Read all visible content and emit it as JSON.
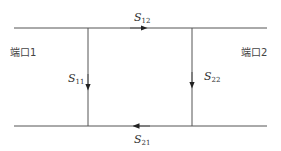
{
  "diagram": {
    "type": "two-port signal flow graph",
    "ports": [
      {
        "id": "port1",
        "label": "端口1"
      },
      {
        "id": "port2",
        "label": "端口2"
      }
    ],
    "branches": [
      {
        "id": "s12",
        "symbol": "S",
        "subscript": "12",
        "direction": "right",
        "position": "top"
      },
      {
        "id": "s21",
        "symbol": "S",
        "subscript": "21",
        "direction": "left",
        "position": "bottom"
      },
      {
        "id": "s11",
        "symbol": "S",
        "subscript": "11",
        "direction": "down",
        "position": "left"
      },
      {
        "id": "s22",
        "symbol": "S",
        "subscript": "22",
        "direction": "down",
        "position": "right"
      }
    ],
    "colors": {
      "line": "#555555",
      "text": "#333333",
      "background": "#ffffff"
    }
  }
}
